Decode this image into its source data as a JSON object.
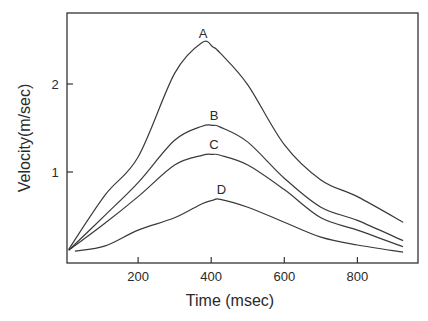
{
  "chart_data": {
    "type": "line",
    "title": "",
    "xlabel": "Time (msec)",
    "ylabel": "Velocity(m/sec)",
    "xlim": [
      0,
      960
    ],
    "ylim": [
      0,
      2.9
    ],
    "x_ticks": [
      200,
      400,
      600,
      800
    ],
    "x_tick_labels": [
      "200",
      "400",
      "600",
      "800"
    ],
    "y_ticks": [
      1,
      2
    ],
    "y_tick_labels": [
      "1",
      "2"
    ],
    "grid": false,
    "legend": "inline labels at curve peaks",
    "x": [
      10,
      110,
      200,
      300,
      375,
      405,
      425,
      500,
      600,
      700,
      800,
      925
    ],
    "series": [
      {
        "name": "A",
        "values": [
          0.12,
          0.74,
          1.17,
          2.12,
          2.47,
          2.42,
          2.35,
          1.99,
          1.31,
          0.91,
          0.72,
          0.43
        ],
        "peak": [
          375,
          2.47
        ]
      },
      {
        "name": "B",
        "values": [
          0.11,
          0.51,
          0.88,
          1.36,
          1.52,
          1.53,
          1.51,
          1.34,
          0.93,
          0.6,
          0.45,
          0.22
        ],
        "peak": [
          405,
          1.53
        ]
      },
      {
        "name": "C",
        "values": [
          0.11,
          0.42,
          0.72,
          1.08,
          1.19,
          1.2,
          1.19,
          1.08,
          0.8,
          0.48,
          0.34,
          0.15
        ],
        "peak": [
          405,
          1.2
        ]
      },
      {
        "name": "D",
        "values": [
          0.1,
          0.16,
          0.34,
          0.48,
          0.64,
          0.68,
          0.69,
          0.6,
          0.43,
          0.26,
          0.17,
          0.09
        ],
        "peak": [
          425,
          0.69
        ]
      }
    ]
  }
}
